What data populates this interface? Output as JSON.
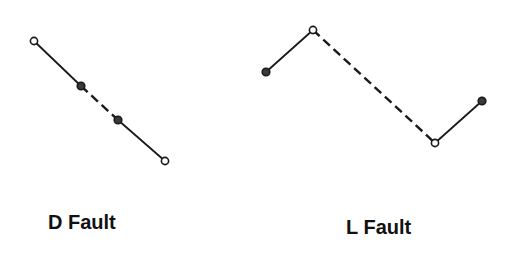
{
  "diagram": {
    "stroke_color": "#1a1a1a",
    "background": "#ffffff",
    "panels": [
      {
        "label": "D Fault",
        "points": [
          {
            "x": 34,
            "y": 41,
            "type": "open"
          },
          {
            "x": 81,
            "y": 86,
            "type": "filled"
          },
          {
            "x": 118,
            "y": 120,
            "type": "filled"
          },
          {
            "x": 165,
            "y": 161,
            "type": "open"
          }
        ],
        "segments": [
          {
            "from": 0,
            "to": 1,
            "style": "solid"
          },
          {
            "from": 1,
            "to": 2,
            "style": "dashed"
          },
          {
            "from": 2,
            "to": 3,
            "style": "solid"
          }
        ]
      },
      {
        "label": "L Fault",
        "points": [
          {
            "x": 266,
            "y": 72,
            "type": "filled"
          },
          {
            "x": 313,
            "y": 30,
            "type": "open"
          },
          {
            "x": 435,
            "y": 143,
            "type": "open"
          },
          {
            "x": 482,
            "y": 101,
            "type": "filled"
          }
        ],
        "segments": [
          {
            "from": 0,
            "to": 1,
            "style": "solid"
          },
          {
            "from": 1,
            "to": 2,
            "style": "dashed"
          },
          {
            "from": 2,
            "to": 3,
            "style": "solid"
          }
        ]
      }
    ]
  }
}
